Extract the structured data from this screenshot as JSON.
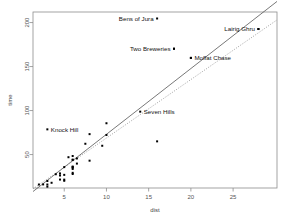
{
  "chart_data": {
    "type": "scatter",
    "title": "",
    "xlabel": "dist",
    "ylabel": "time",
    "xlim": [
      1.3,
      30.2
    ],
    "ylim": [
      12,
      212
    ],
    "grid": false,
    "legend": "none",
    "xticks": [
      5,
      10,
      15,
      20,
      25
    ],
    "xtick_labels": [
      "5",
      "10",
      "15",
      "20",
      "25"
    ],
    "yticks": [
      50,
      100,
      150,
      200
    ],
    "ytick_labels": [
      "50",
      "100",
      "150",
      "200"
    ],
    "points": [
      {
        "x": 2.5,
        "y": 16.083
      },
      {
        "x": 6.0,
        "y": 48.35
      },
      {
        "x": 6.0,
        "y": 33.65
      },
      {
        "x": 6.5,
        "y": 45.6
      },
      {
        "x": 7.5,
        "y": 62.267
      },
      {
        "x": 8.0,
        "y": 73.217
      },
      {
        "x": 8.0,
        "y": 43.05
      },
      {
        "x": 16.0,
        "y": 65.0
      },
      {
        "x": 6.0,
        "y": 44.133
      },
      {
        "x": 5.0,
        "y": 26.933
      },
      {
        "x": 6.0,
        "y": 35.75
      },
      {
        "x": 28.0,
        "y": 192.667
      },
      {
        "x": 5.0,
        "y": 35.75
      },
      {
        "x": 9.5,
        "y": 60.0
      },
      {
        "x": 6.0,
        "y": 44.0
      },
      {
        "x": 4.5,
        "y": 26.217
      },
      {
        "x": 10.0,
        "y": 85.583
      },
      {
        "x": 6.0,
        "y": 35.3
      },
      {
        "x": 18.0,
        "y": 170.25
      },
      {
        "x": 4.5,
        "y": 28.567
      },
      {
        "x": 3.0,
        "y": 15.95
      },
      {
        "x": 4.5,
        "y": 21.6
      },
      {
        "x": 5.5,
        "y": 46.983
      },
      {
        "x": 3.0,
        "y": 13.533
      },
      {
        "x": 3.5,
        "y": 17.933
      },
      {
        "x": 6.0,
        "y": 27.9
      },
      {
        "x": 2.0,
        "y": 15.95
      },
      {
        "x": 3.0,
        "y": 19.95
      },
      {
        "x": 4.0,
        "y": 27.65
      },
      {
        "x": 6.0,
        "y": 29.233
      },
      {
        "x": 5.0,
        "y": 21.517
      },
      {
        "x": 6.5,
        "y": 39.75
      },
      {
        "x": 5.0,
        "y": 20.2
      },
      {
        "x": 10.0,
        "y": 72.25
      },
      {
        "x": 6.0,
        "y": 36.367
      },
      {
        "x": 20.0,
        "y": 159.833
      }
    ],
    "labeled_points": [
      {
        "label": "Bens of Jura",
        "x": 16.0,
        "y": 204.617,
        "label_side": "left"
      },
      {
        "label": "Lairig Ghru",
        "x": 28.0,
        "y": 192.667,
        "label_side": "left"
      },
      {
        "label": "Two Breweries",
        "x": 18.0,
        "y": 170.25,
        "label_side": "left"
      },
      {
        "label": "Moffat Chase",
        "x": 20.0,
        "y": 159.833,
        "label_side": "right"
      },
      {
        "label": "Seven Hills",
        "x": 14.0,
        "y": 98.75,
        "label_side": "right"
      },
      {
        "label": "Knock Hill",
        "x": 3.0,
        "y": 78.65,
        "label_side": "right"
      }
    ],
    "fit_lines": [
      {
        "name": "least-squares-fit",
        "style": "solid",
        "x1": 1.3,
        "y1": 8.0,
        "x2": 30.2,
        "y2": 224.0
      },
      {
        "name": "robust-fit",
        "style": "dotted",
        "x1": 1.3,
        "y1": 11.0,
        "x2": 30.2,
        "y2": 203.0
      }
    ]
  }
}
